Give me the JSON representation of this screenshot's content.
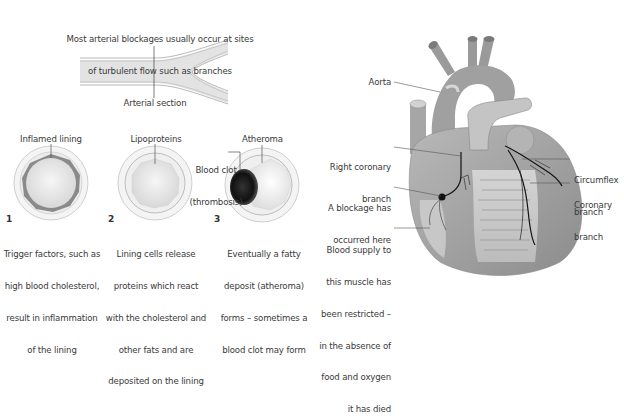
{
  "artery": {
    "title_line1": "Most arterial blockages usually occur at sites",
    "title_line2": "of turbulent flow such as branches",
    "section_label": "Arterial section"
  },
  "stages": [
    {
      "number": "1",
      "label": "Inflamed lining",
      "caption": [
        "Trigger factors, such as",
        "high blood cholesterol,",
        "result in inflammation",
        "of the lining"
      ]
    },
    {
      "number": "2",
      "label": "Lipoproteins",
      "caption": [
        "Lining cells release",
        "proteins which react",
        "with the cholesterol and",
        "other fats and are",
        "deposited on the lining"
      ]
    },
    {
      "number": "3",
      "label": "Atheroma",
      "clot_label": [
        "Blood clot",
        "(thrombosis)"
      ],
      "caption": [
        "Eventually a fatty",
        "deposit (atheroma)",
        "forms – sometimes a",
        "blood clot may form"
      ]
    }
  ],
  "heart": {
    "labels": {
      "aorta": "Aorta",
      "right_coronary": [
        "Right coronary",
        "branch"
      ],
      "blockage": [
        "A blockage has",
        "occurred here"
      ],
      "blood_supply": [
        "Blood supply to",
        "this muscle has",
        "been restricted –",
        "in the absence of",
        "food and oxygen",
        "it has died"
      ],
      "circumflex": [
        "Circumflex",
        "branch"
      ],
      "coronary": [
        "Coronary",
        "branch"
      ]
    }
  },
  "colors": {
    "vessel_fill": "#e2e2e2",
    "lining_inflamed": "#8a8a8a",
    "clot": "#1a1a1a",
    "heart_mid": "#9a9a9a",
    "leader_line": "#555555"
  }
}
